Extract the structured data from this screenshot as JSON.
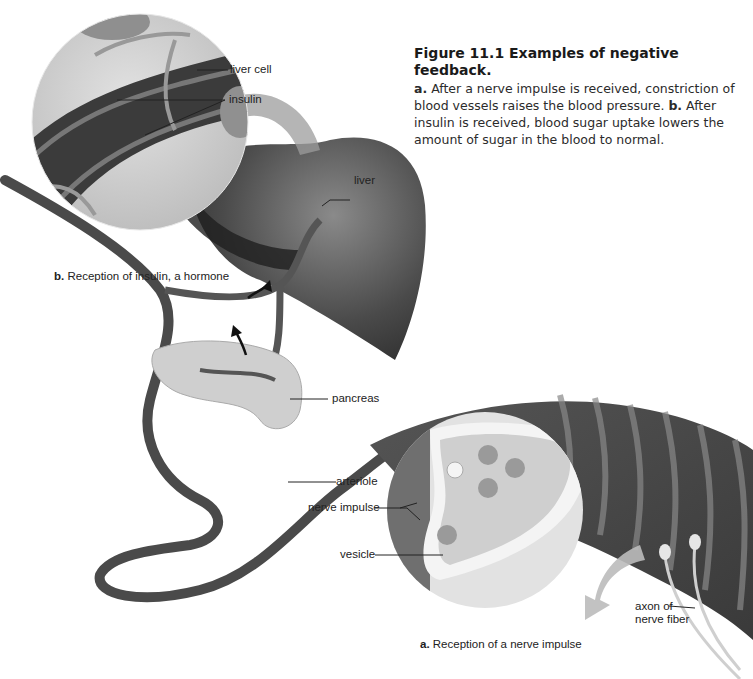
{
  "figure": {
    "title": "Figure 11.1  Examples of negative feedback.",
    "caption_parts": [
      {
        "bold": "a.",
        "text": " After a nerve impulse is received, constriction of blood vessels raises the blood pressure. "
      },
      {
        "bold": "b.",
        "text": " After insulin is received, blood sugar uptake lowers the amount of sugar in the blood to normal."
      }
    ]
  },
  "panel_b": {
    "letter": "b.",
    "title": " Reception of insulin, a hormone",
    "labels": {
      "liver_cell": "liver cell",
      "insulin": "insulin",
      "liver": "liver",
      "pancreas": "pancreas"
    }
  },
  "panel_a": {
    "letter": "a.",
    "title": " Reception of a nerve impulse",
    "labels": {
      "arteriole": "arteriole",
      "nerve_impulse": "nerve impulse",
      "vesicle": "vesicle",
      "axon_line1": "axon of",
      "axon_line2": "nerve fiber"
    }
  },
  "colors": {
    "background": "#ffffff",
    "tissue_dark": "#3a3a3a",
    "tissue_mid": "#7a7a7a",
    "tissue_light": "#d8d8d8",
    "magnifier_fill": "#cfcfcf",
    "pancreas_fill": "#c9c9c9",
    "label_text": "#222222"
  }
}
